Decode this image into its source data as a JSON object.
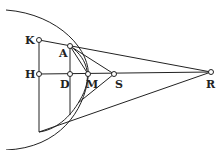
{
  "diagram": {
    "points": {
      "K": {
        "label": "K",
        "x": 39,
        "y": 40
      },
      "A": {
        "label": "A",
        "x": 70,
        "y": 46
      },
      "H": {
        "label": "H",
        "x": 39,
        "y": 74
      },
      "D": {
        "label": "D",
        "x": 70,
        "y": 74
      },
      "M": {
        "label": "M",
        "x": 88,
        "y": 74
      },
      "S": {
        "label": "S",
        "x": 114,
        "y": 74
      },
      "R": {
        "label": "R",
        "x": 211,
        "y": 72
      }
    },
    "stroke_color": "#222222"
  }
}
